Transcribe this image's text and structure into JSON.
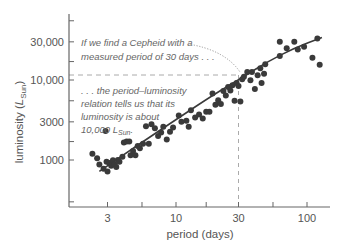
{
  "chart_data": {
    "type": "scatter",
    "title": "",
    "xlabel": "period (days)",
    "ylabel": "luminosity (L_Sun)",
    "ylabel_parts": {
      "main": "luminosity (",
      "symbol": "L",
      "subscript": "Sun",
      "close": ")"
    },
    "x_scale": "log",
    "y_scale": "log",
    "xlim": [
      1.5,
      150
    ],
    "ylim": [
      250,
      40000
    ],
    "x_ticks": [
      {
        "value": 3,
        "label": "3"
      },
      {
        "value": 5.5,
        "label": ""
      },
      {
        "value": 10,
        "label": "10"
      },
      {
        "value": 17,
        "label": ""
      },
      {
        "value": 30,
        "label": "30"
      },
      {
        "value": 55,
        "label": ""
      },
      {
        "value": 100,
        "label": "100"
      }
    ],
    "y_ticks": [
      {
        "value": 300,
        "label": ""
      },
      {
        "value": 1000,
        "label": "1000"
      },
      {
        "value": 1700,
        "label": ""
      },
      {
        "value": 3000,
        "label": "3000"
      },
      {
        "value": 5500,
        "label": ""
      },
      {
        "value": 10000,
        "label": "10,000"
      },
      {
        "value": 17000,
        "label": ""
      },
      {
        "value": 30000,
        "label": "30,000"
      },
      {
        "value": 55000,
        "label": ""
      }
    ],
    "grid": false,
    "legend": null,
    "colors": {
      "points": "#3a3a3a",
      "curve": "#3a3a3a",
      "axis": "#666666",
      "guide": "#aaaaaa"
    },
    "series": [
      {
        "name": "Cepheid variables",
        "type": "scatter",
        "points": [
          [
            2.3,
            1200
          ],
          [
            2.5,
            1050
          ],
          [
            2.6,
            880
          ],
          [
            2.8,
            780
          ],
          [
            2.9,
            2300
          ],
          [
            2.95,
            950
          ],
          [
            3.0,
            720
          ],
          [
            3.1,
            920
          ],
          [
            3.2,
            850
          ],
          [
            3.3,
            990
          ],
          [
            3.4,
            880
          ],
          [
            3.5,
            820
          ],
          [
            3.6,
            1000
          ],
          [
            3.7,
            950
          ],
          [
            3.9,
            1100
          ],
          [
            4.0,
            1650
          ],
          [
            4.2,
            1700
          ],
          [
            4.4,
            1700
          ],
          [
            4.5,
            1150
          ],
          [
            4.7,
            1300
          ],
          [
            4.9,
            1150
          ],
          [
            5.1,
            1500
          ],
          [
            5.3,
            1400
          ],
          [
            5.6,
            1600
          ],
          [
            5.9,
            2650
          ],
          [
            6.2,
            1600
          ],
          [
            6.5,
            2800
          ],
          [
            6.9,
            2500
          ],
          [
            7.3,
            2000
          ],
          [
            7.7,
            2200
          ],
          [
            8.0,
            2600
          ],
          [
            8.5,
            1800
          ],
          [
            9.0,
            2250
          ],
          [
            9.5,
            2550
          ],
          [
            10.5,
            3600
          ],
          [
            11.0,
            3000
          ],
          [
            12.0,
            3100
          ],
          [
            12.5,
            2600
          ],
          [
            13.0,
            4200
          ],
          [
            14.0,
            3400
          ],
          [
            15.0,
            3700
          ],
          [
            16.0,
            3300
          ],
          [
            17.0,
            4000
          ],
          [
            18.0,
            4000
          ],
          [
            19.0,
            6800
          ],
          [
            20.0,
            4900
          ],
          [
            21.0,
            5600
          ],
          [
            22.0,
            5000
          ],
          [
            23.0,
            7300
          ],
          [
            24.0,
            6400
          ],
          [
            25.0,
            8200
          ],
          [
            26.0,
            7400
          ],
          [
            27.0,
            8600
          ],
          [
            28.0,
            5500
          ],
          [
            29.0,
            9200
          ],
          [
            30.0,
            8400
          ],
          [
            31.0,
            5400
          ],
          [
            32.0,
            10200
          ],
          [
            33.0,
            11000
          ],
          [
            35.0,
            12600
          ],
          [
            37.0,
            9900
          ],
          [
            38.0,
            12600
          ],
          [
            40.0,
            7700
          ],
          [
            42.0,
            11500
          ],
          [
            44.0,
            14000
          ],
          [
            45.0,
            9200
          ],
          [
            47.0,
            12000
          ],
          [
            48.0,
            15700
          ],
          [
            62.0,
            30000
          ],
          [
            62.0,
            20000
          ],
          [
            70.0,
            25000
          ],
          [
            80.0,
            30000
          ],
          [
            85.0,
            24000
          ],
          [
            95.0,
            26000
          ],
          [
            110.0,
            19000
          ],
          [
            120.0,
            33000
          ],
          [
            125.0,
            15500
          ]
        ]
      },
      {
        "name": "period-luminosity relation",
        "type": "line",
        "points": [
          [
            2.6,
            720
          ],
          [
            5,
            1500
          ],
          [
            10,
            3200
          ],
          [
            20,
            6800
          ],
          [
            30,
            10000
          ],
          [
            50,
            17000
          ],
          [
            80,
            25000
          ],
          [
            130,
            34000
          ]
        ]
      }
    ],
    "guides": {
      "period_value": 30,
      "luminosity_value": 10000
    },
    "annotations": [
      {
        "text_lines": [
          "If we find a Cepheid with a",
          "measured period of 30 days . . ."
        ]
      },
      {
        "text_lines": [
          ". . . the period–luminosity",
          "relation tells us that its",
          "luminosity is about"
        ],
        "last_line": {
          "value": "10,000",
          "symbol": "L",
          "subscript": "Sun",
          "end": "."
        }
      }
    ]
  }
}
